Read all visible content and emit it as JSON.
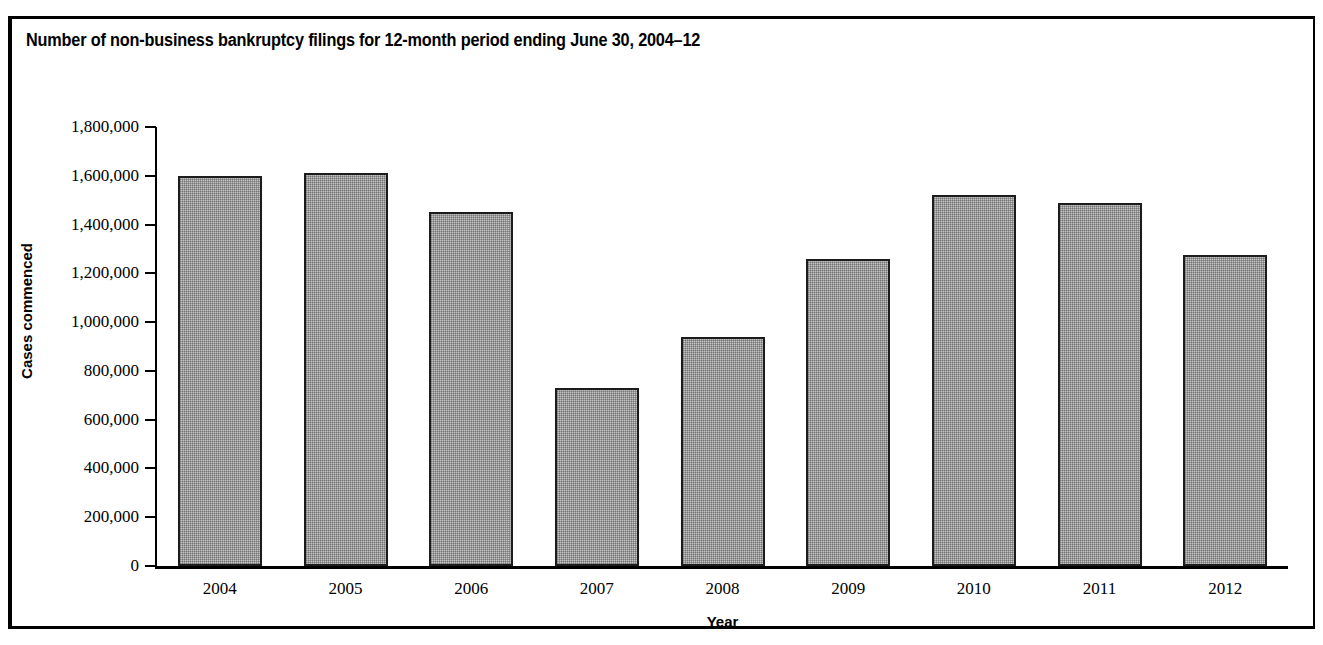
{
  "figure": {
    "title": "Number of non-business bankruptcy filings for 12-month period ending June 30, 2004–12",
    "border_color": "#000000",
    "background_color": "#ffffff"
  },
  "chart_data": {
    "type": "bar",
    "title": "Number of non-business bankruptcy filings for 12-month period ending June 30, 2004–12",
    "xlabel": "Year",
    "ylabel": "Cases commenced",
    "categories": [
      "2004",
      "2005",
      "2006",
      "2007",
      "2008",
      "2009",
      "2010",
      "2011",
      "2012"
    ],
    "values": [
      1600000,
      1610000,
      1450000,
      730000,
      940000,
      1260000,
      1520000,
      1490000,
      1275000
    ],
    "ylim": [
      0,
      1800000
    ],
    "ytick_values": [
      0,
      200000,
      400000,
      600000,
      800000,
      1000000,
      1200000,
      1400000,
      1600000,
      1800000
    ],
    "ytick_labels": [
      "0",
      "200,000",
      "400,000",
      "600,000",
      "800,000",
      "1,000,000",
      "1,200,000",
      "1,400,000",
      "1,600,000",
      "1,800,000"
    ],
    "grid": false,
    "legend": false,
    "bar_fill_color": "#c3c3c3",
    "bar_edge_color": "#1c1c1c",
    "bar_fill_pattern": "stipple"
  }
}
